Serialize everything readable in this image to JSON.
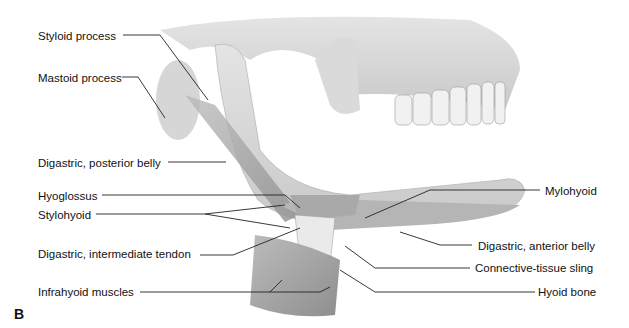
{
  "figure": {
    "panel_letter": "B",
    "labels_left": [
      {
        "text": "Styloid process",
        "x": 38,
        "y": 30
      },
      {
        "text": "Mastoid process",
        "x": 38,
        "y": 72
      },
      {
        "text": "Digastric, posterior belly",
        "x": 38,
        "y": 157
      },
      {
        "text": "Hyoglossus",
        "x": 38,
        "y": 190
      },
      {
        "text": "Stylohyoid",
        "x": 38,
        "y": 209
      },
      {
        "text": "Digastric, intermediate tendon",
        "x": 38,
        "y": 248
      },
      {
        "text": "Infrahyoid muscles",
        "x": 38,
        "y": 286
      }
    ],
    "labels_right": [
      {
        "text": "Mylohyoid",
        "x": 545,
        "y": 185
      },
      {
        "text": "Digastric, anterior belly",
        "x": 478,
        "y": 240
      },
      {
        "text": "Connective-tissue sling",
        "x": 475,
        "y": 262
      },
      {
        "text": "Hyoid bone",
        "x": 538,
        "y": 286
      }
    ]
  }
}
